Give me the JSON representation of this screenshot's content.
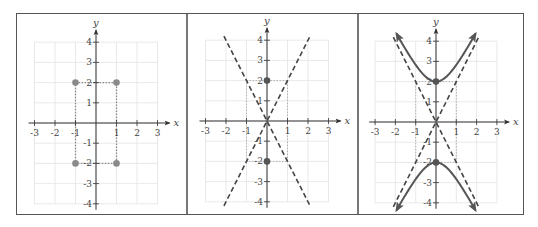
{
  "chart_data": [
    {
      "type": "line",
      "title": "",
      "xlabel": "x",
      "ylabel": "y",
      "xlim": [
        -3,
        3
      ],
      "ylim": [
        -4,
        4
      ],
      "grid": true,
      "xticks": [
        "-3",
        "-2",
        "-1",
        "1",
        "2",
        "3"
      ],
      "yticks": [
        "4",
        "3",
        "2",
        "1",
        "-1",
        "-2",
        "-3",
        "-4"
      ],
      "points": [
        {
          "x": -1,
          "y": 2
        },
        {
          "x": 1,
          "y": 2
        },
        {
          "x": -1,
          "y": -2
        },
        {
          "x": 1,
          "y": -2
        }
      ],
      "rectangle": {
        "x1": -1,
        "y1": -2,
        "x2": 1,
        "y2": 2,
        "style": "dotted"
      },
      "point_color": "#8a8a8a"
    },
    {
      "type": "line",
      "title": "",
      "xlabel": "x",
      "ylabel": "y",
      "xlim": [
        -3,
        3
      ],
      "ylim": [
        -4,
        4
      ],
      "grid": true,
      "xticks": [
        "-3",
        "-2",
        "-1",
        "1",
        "2",
        "3"
      ],
      "yticks": [
        "4",
        "3",
        "2",
        "1",
        "-1",
        "-2",
        "-3",
        "-4"
      ],
      "points": [
        {
          "x": 0,
          "y": 2
        },
        {
          "x": 0,
          "y": -2
        }
      ],
      "rectangle": {
        "x1": -1,
        "y1": -2,
        "x2": 1,
        "y2": 2,
        "style": "dotted"
      },
      "series": [
        {
          "name": "asymptote y=2x",
          "style": "dashed",
          "x": [
            -2.1,
            2.1
          ],
          "y": [
            -4.2,
            4.2
          ]
        },
        {
          "name": "asymptote y=-2x",
          "style": "dashed",
          "x": [
            -2.1,
            2.1
          ],
          "y": [
            4.2,
            -4.2
          ]
        }
      ],
      "point_color": "#555555"
    },
    {
      "type": "line",
      "title": "",
      "xlabel": "x",
      "ylabel": "y",
      "xlim": [
        -3,
        3
      ],
      "ylim": [
        -4,
        4
      ],
      "grid": true,
      "xticks": [
        "-3",
        "-2",
        "-1",
        "1",
        "2",
        "3"
      ],
      "yticks": [
        "4",
        "3",
        "2",
        "1",
        "-1",
        "-2",
        "-3",
        "-4"
      ],
      "points": [
        {
          "x": 0,
          "y": 2
        },
        {
          "x": 0,
          "y": -2
        }
      ],
      "rectangle": {
        "x1": -1,
        "y1": -2,
        "x2": 1,
        "y2": 2,
        "style": "dotted"
      },
      "series": [
        {
          "name": "asymptote y=2x",
          "style": "dashed",
          "x": [
            -2.1,
            2.1
          ],
          "y": [
            -4.2,
            4.2
          ]
        },
        {
          "name": "asymptote y=-2x",
          "style": "dashed",
          "x": [
            -2.1,
            2.1
          ],
          "y": [
            4.2,
            -4.2
          ]
        },
        {
          "name": "hyperbola y^2/4 - x^2 = 1 (upper)",
          "style": "solid",
          "equation": "y = 2*sqrt(1+x^2)",
          "xrange": [
            -1.95,
            1.95
          ],
          "arrows": true
        },
        {
          "name": "hyperbola y^2/4 - x^2 = 1 (lower)",
          "style": "solid",
          "equation": "y = -2*sqrt(1+x^2)",
          "xrange": [
            -1.95,
            1.95
          ],
          "arrows": true
        }
      ],
      "point_color": "#555555",
      "curve_color": "#555555"
    }
  ],
  "layout": {
    "panels": [
      {
        "left": 0,
        "width": 170,
        "origin": [
          79,
          109
        ],
        "unit": [
          20.5,
          20.2
        ]
      },
      {
        "left": 170,
        "width": 171,
        "origin": [
          80,
          107
        ],
        "unit": [
          20.5,
          20.2
        ]
      },
      {
        "left": 341,
        "width": 167,
        "origin": [
          78,
          108
        ],
        "unit": [
          20.3,
          20.2
        ]
      }
    ]
  }
}
